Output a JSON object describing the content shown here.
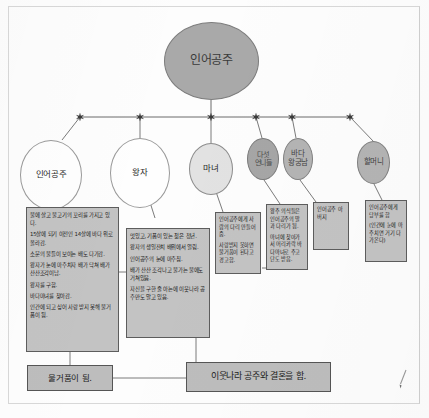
{
  "diagram": {
    "title": "인어공주",
    "root": {
      "label": "인어공주"
    },
    "characters": [
      {
        "id": "mermaid",
        "label": "인어공주"
      },
      {
        "id": "prince",
        "label": "왕자"
      },
      {
        "id": "witch",
        "label": "마녀"
      },
      {
        "id": "sisters",
        "label": "다섯\n언니들"
      },
      {
        "id": "sea-king",
        "label": "바다\n왕궁남"
      },
      {
        "id": "grandmother",
        "label": "할머니"
      }
    ],
    "detail_boxes": [
      {
        "id": "mermaid-detail",
        "owner": "mermaid",
        "lines": [
          "물에 살고 물고기의 꼬리를 가지고 있다.",
          "15살에 되기 이전인 14살에 바다 위로 올라감.",
          "소문의 물들이 보이는 배도 다가감.",
          "왕자가 눈에 마주치자 배가 닥쳐 배가 산산조각이남.",
          "왕자를 구함.",
          "바다마녀를 찾아감.",
          "인간에 되고 싶어 사랑 받지 못해 물거품이 됨."
        ]
      },
      {
        "id": "prince-detail",
        "owner": "prince",
        "lines": [
          "멋있고, 기품이 있는 젊은 청년.",
          "왕자의 생일잔치 배위에서 열림.",
          "인어공주의 눈에 마주침.",
          "배가 산산 조각나고 물가는 물에도 거쳐있음.",
          "자신을 구한 줄 아는에 이웃나라 공주만도 알고 있음."
        ]
      },
      {
        "id": "witch-detail",
        "owner": "witch",
        "lines": [
          "인어공주에게 사람의 다리 만들어 줌.",
          "사랑받지 못하면 물거품이 된다고 경고함."
        ]
      },
      {
        "id": "sisters-detail",
        "owner": "sisters",
        "lines": [
          "왕주 의식들은 인어공주의 말과 다리가 됨.",
          "마녀에 찾아가서 머리카락 바다마녀로 주고 단도 받음."
        ]
      },
      {
        "id": "seaking-detail",
        "owner": "sea-king",
        "lines": [
          "인어공주 아버지"
        ]
      },
      {
        "id": "grandmother-detail",
        "owner": "grandmother",
        "lines": [
          "인어공주에게 당부를 함",
          "(인간에 눈에 마주치면 거기 다가온다)"
        ]
      }
    ],
    "outcomes": [
      {
        "id": "outcome-mermaid",
        "label": "물거품이 됨."
      },
      {
        "id": "outcome-prince",
        "label": "이웃나라 공주와 결혼을 함."
      }
    ],
    "colors": {
      "root_fill": "#a9a9a9",
      "node_white_fill": "#fefefe",
      "node_light_fill": "#e2e2e2",
      "node_dark_fill": "#a6a6a6",
      "box_fill": "#c3c3c3",
      "line": "#6b6b6b"
    }
  }
}
